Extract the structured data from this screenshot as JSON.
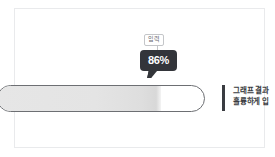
{
  "card": {
    "name": "progress-illustration-card"
  },
  "progress": {
    "value": 86,
    "value_label": "86%",
    "fill_percent": 79,
    "track_color": "#6d6f73",
    "fill_color": "#e3e3e3"
  },
  "tooltip": {
    "chip_label": "입력",
    "badge_label": "86%",
    "badge_color": "#33353a",
    "chip_border_color": "#c4c6c9"
  },
  "annotation": {
    "accent_color": "#3a3c41",
    "line_1": "그래프 결과",
    "line_2": "훌륭하게 입"
  }
}
